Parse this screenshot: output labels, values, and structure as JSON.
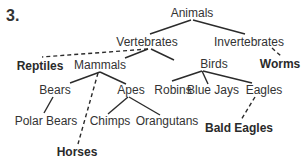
{
  "question_number": "3.",
  "nodes": {
    "animals": {
      "label": "Animals",
      "x": 192,
      "y": 6,
      "bold": false
    },
    "vertebrates": {
      "label": "Vertebrates",
      "x": 147,
      "y": 35,
      "bold": false
    },
    "invertebrates": {
      "label": "Invertebrates",
      "x": 249,
      "y": 35,
      "bold": false
    },
    "reptiles": {
      "label": "Reptiles",
      "x": 40,
      "y": 59,
      "bold": true
    },
    "mammals": {
      "label": "Mammals",
      "x": 100,
      "y": 58,
      "bold": false
    },
    "birds": {
      "label": "Birds",
      "x": 214,
      "y": 57,
      "bold": false
    },
    "worms": {
      "label": "Worms",
      "x": 280,
      "y": 57,
      "bold": true
    },
    "bears": {
      "label": "Bears",
      "x": 55,
      "y": 83,
      "bold": false
    },
    "apes": {
      "label": "Apes",
      "x": 131,
      "y": 83,
      "bold": false
    },
    "robins": {
      "label": "Robins",
      "x": 173,
      "y": 83,
      "bold": false
    },
    "blue_jays": {
      "label": "Blue Jays",
      "x": 213,
      "y": 83,
      "bold": false
    },
    "eagles": {
      "label": "Eagles",
      "x": 264,
      "y": 83,
      "bold": false
    },
    "polar_bears": {
      "label": "Polar Bears",
      "x": 46,
      "y": 114,
      "bold": false
    },
    "chimps": {
      "label": "Chimps",
      "x": 110,
      "y": 114,
      "bold": false
    },
    "orangutans": {
      "label": "Orangutans",
      "x": 167,
      "y": 114,
      "bold": false
    },
    "bald_eagles": {
      "label": "Bald Eagles",
      "x": 239,
      "y": 121,
      "bold": true
    },
    "horses": {
      "label": "Horses",
      "x": 77,
      "y": 145,
      "bold": true
    }
  },
  "edges": [
    {
      "from": "animals",
      "to": "vertebrates",
      "style": "solid",
      "x1": 191,
      "y1": 20,
      "x2": 150,
      "y2": 34
    },
    {
      "from": "animals",
      "to": "invertebrates",
      "style": "solid",
      "x1": 193,
      "y1": 20,
      "x2": 245,
      "y2": 34
    },
    {
      "from": "vertebrates",
      "to": "reptiles",
      "style": "dashed",
      "x1": 148,
      "y1": 49,
      "x2": 42,
      "y2": 57
    },
    {
      "from": "vertebrates",
      "to": "mammals",
      "style": "solid",
      "x1": 148,
      "y1": 49,
      "x2": 125,
      "y2": 58
    },
    {
      "from": "vertebrates",
      "to": "birds",
      "style": "solid",
      "x1": 151,
      "y1": 49,
      "x2": 174,
      "y2": 60
    },
    {
      "from": "invertebrates",
      "to": "worms",
      "style": "dashed",
      "x1": 272,
      "y1": 48,
      "x2": 281,
      "y2": 56
    },
    {
      "from": "mammals",
      "to": "bears",
      "style": "solid",
      "x1": 100,
      "y1": 72,
      "x2": 70,
      "y2": 83
    },
    {
      "from": "mammals",
      "to": "apes",
      "style": "solid",
      "x1": 100,
      "y1": 72,
      "x2": 126,
      "y2": 84
    },
    {
      "from": "mammals",
      "to": "horses",
      "style": "dashed",
      "x1": 98,
      "y1": 73,
      "x2": 78,
      "y2": 144
    },
    {
      "from": "birds",
      "to": "robins",
      "style": "solid",
      "x1": 202,
      "y1": 71,
      "x2": 172,
      "y2": 81
    },
    {
      "from": "birds",
      "to": "blue_jays",
      "style": "solid",
      "x1": 202,
      "y1": 71,
      "x2": 208,
      "y2": 84
    },
    {
      "from": "birds",
      "to": "eagles",
      "style": "solid",
      "x1": 203,
      "y1": 71,
      "x2": 252,
      "y2": 83
    },
    {
      "from": "bears",
      "to": "polar_bears",
      "style": "solid",
      "x1": 53,
      "y1": 97,
      "x2": 44,
      "y2": 113
    },
    {
      "from": "apes",
      "to": "chimps",
      "style": "solid",
      "x1": 128,
      "y1": 97,
      "x2": 108,
      "y2": 114
    },
    {
      "from": "apes",
      "to": "orangutans",
      "style": "solid",
      "x1": 129,
      "y1": 97,
      "x2": 160,
      "y2": 115
    },
    {
      "from": "eagles",
      "to": "bald_eagles",
      "style": "dashed",
      "x1": 255,
      "y1": 97,
      "x2": 241,
      "y2": 120
    }
  ],
  "colors": {
    "line": "#2b2b2b",
    "text": "#333333",
    "background": "#ffffff"
  }
}
